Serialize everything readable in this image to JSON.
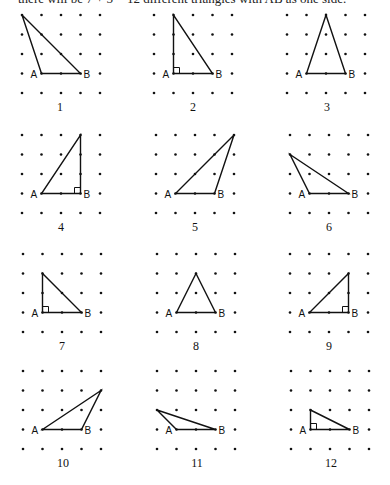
{
  "caption": "there will be 7 + 5 = 12 different triangles with AB as one side.",
  "grid": {
    "cols": 5,
    "rows": 5,
    "spacing": 19.5,
    "dot_radius": 1.3,
    "line_color": "#111111",
    "dot_color": "#111111"
  },
  "labels": {
    "a": "A",
    "b": "B"
  },
  "panels": [
    {
      "number": "1",
      "origin": [
        22,
        15
      ],
      "apex": [
        0,
        0
      ],
      "right_angle": null,
      "num_pos": [
        60,
        100
      ]
    },
    {
      "number": "2",
      "origin": [
        154,
        15
      ],
      "apex": [
        1,
        0
      ],
      "right_angle": "A",
      "num_pos": [
        193,
        100
      ]
    },
    {
      "number": "3",
      "origin": [
        287,
        15
      ],
      "apex": [
        2,
        0
      ],
      "right_angle": null,
      "num_pos": [
        327,
        100
      ]
    },
    {
      "number": "4",
      "origin": [
        22,
        135
      ],
      "apex": [
        3,
        0
      ],
      "right_angle": "B",
      "num_pos": [
        61,
        220
      ]
    },
    {
      "number": "5",
      "origin": [
        156,
        135
      ],
      "apex": [
        4,
        0
      ],
      "right_angle": null,
      "num_pos": [
        195,
        220
      ]
    },
    {
      "number": "6",
      "origin": [
        290,
        135
      ],
      "apex": [
        0,
        1
      ],
      "right_angle": null,
      "num_pos": [
        329,
        220
      ]
    },
    {
      "number": "7",
      "origin": [
        23,
        254
      ],
      "apex": [
        1,
        1
      ],
      "right_angle": "A",
      "num_pos": [
        62,
        339
      ]
    },
    {
      "number": "8",
      "origin": [
        157,
        254
      ],
      "apex": [
        2,
        1
      ],
      "right_angle": null,
      "num_pos": [
        196,
        339
      ]
    },
    {
      "number": "9",
      "origin": [
        290,
        254
      ],
      "apex": [
        3,
        1
      ],
      "right_angle": "B",
      "num_pos": [
        329,
        339
      ]
    },
    {
      "number": "10",
      "origin": [
        23,
        371
      ],
      "apex": [
        4,
        1
      ],
      "right_angle": null,
      "num_pos": [
        63,
        456
      ]
    },
    {
      "number": "11",
      "origin": [
        157,
        371
      ],
      "apex": [
        0,
        2
      ],
      "right_angle": null,
      "num_pos": [
        197,
        456
      ]
    },
    {
      "number": "12",
      "origin": [
        291,
        371
      ],
      "apex": [
        1,
        2
      ],
      "right_angle": "A",
      "num_pos": [
        331,
        456
      ]
    }
  ],
  "segment_ab": {
    "a": [
      1,
      3
    ],
    "b": [
      3,
      3
    ]
  }
}
